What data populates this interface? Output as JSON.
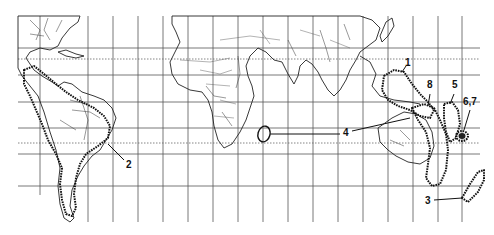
{
  "map": {
    "type": "world distribution map",
    "projection": "cylindrical, grid graticule",
    "grid": {
      "vertical_lines_x": [
        40,
        88,
        113,
        138,
        163,
        188,
        213,
        238,
        263,
        288,
        313,
        338,
        363,
        388,
        413,
        438,
        462
      ],
      "horizontal_lines_y": [
        16,
        48,
        75,
        102,
        128,
        154,
        180
      ],
      "tropic_dashed_y": [
        59,
        132
      ]
    },
    "labels": [
      {
        "id": "1",
        "text": "1",
        "x": 405,
        "y": 63
      },
      {
        "id": "2",
        "text": "2",
        "x": 127,
        "y": 163
      },
      {
        "id": "3",
        "text": "3",
        "x": 425,
        "y": 199
      },
      {
        "id": "4",
        "text": "4",
        "x": 344,
        "y": 131
      },
      {
        "id": "5",
        "text": "5",
        "x": 452,
        "y": 82
      },
      {
        "id": "6,7",
        "text": "6,7",
        "x": 467,
        "y": 99
      },
      {
        "id": "8",
        "text": "8",
        "x": 428,
        "y": 82
      }
    ],
    "ranges": [
      {
        "id": "1",
        "region": "Philippines / Indonesia / New Guinea"
      },
      {
        "id": "2",
        "region": "Central & South America (Andes to Patagonia)"
      },
      {
        "id": "3",
        "region": "New Zealand"
      },
      {
        "id": "4",
        "region": "Madagascar"
      },
      {
        "id": "5",
        "region": "Melanesia (Solomon Islands)"
      },
      {
        "id": "6,7",
        "region": "New Caledonia / Vanuatu"
      },
      {
        "id": "8",
        "region": "New Guinea / Eastern Australia"
      }
    ],
    "colors": {
      "ink": "#111111",
      "grid": "#555555",
      "paper": "#ffffff"
    }
  }
}
